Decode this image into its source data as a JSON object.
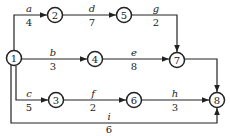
{
  "nodes": {
    "n1": "1",
    "n2": "2",
    "n3": "3",
    "n4": "4",
    "n5": "5",
    "n6": "6",
    "n7": "7",
    "n8": "8"
  },
  "activities": {
    "a": {
      "name": "a",
      "duration": "4"
    },
    "b": {
      "name": "b",
      "duration": "3"
    },
    "c": {
      "name": "c",
      "duration": "5"
    },
    "d": {
      "name": "d",
      "duration": "7"
    },
    "e": {
      "name": "e",
      "duration": "8"
    },
    "f": {
      "name": "f",
      "duration": "2"
    },
    "g": {
      "name": "g",
      "duration": "2"
    },
    "h": {
      "name": "h",
      "duration": "3"
    },
    "i": {
      "name": "i",
      "duration": "6"
    }
  }
}
